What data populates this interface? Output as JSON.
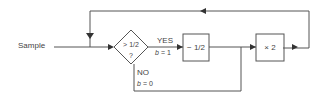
{
  "diagram": {
    "input_label": "Sample",
    "decision": {
      "line1": "> 1/2",
      "line2": "?"
    },
    "yes_branch": {
      "label": "YES",
      "b_label": "b",
      "b_value": "= 1"
    },
    "no_branch": {
      "label": "NO",
      "b_label": "b",
      "b_value": "= 0"
    },
    "subtract_box": {
      "label": "− 1/2"
    },
    "multiply_box": {
      "label": "× 2"
    },
    "stroke_color": "#555555"
  }
}
